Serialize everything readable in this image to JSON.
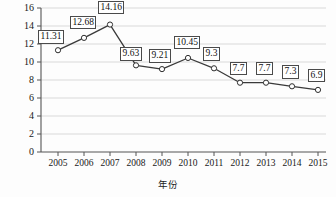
{
  "chart_data": {
    "type": "line",
    "title": "",
    "xlabel": "年份",
    "ylabel": "经济增速(%)",
    "categories": [
      "2005",
      "2006",
      "2007",
      "2008",
      "2009",
      "2010",
      "2011",
      "2012",
      "2013",
      "2014",
      "2015"
    ],
    "values": [
      11.31,
      12.68,
      14.16,
      9.63,
      9.21,
      10.45,
      9.3,
      7.7,
      7.7,
      7.3,
      6.9
    ],
    "data_labels": [
      "11.31",
      "12.68",
      "14.16",
      "9.63",
      "9.21",
      "10.45",
      "9.3",
      "7.7",
      "7.7",
      "7.3",
      "6.9"
    ],
    "ylim": [
      0,
      16
    ],
    "ytick_labels": [
      "0",
      "2",
      "4",
      "6",
      "8",
      "10",
      "12",
      "14",
      "16"
    ],
    "ytick_values": [
      0,
      2,
      4,
      6,
      8,
      10,
      12,
      14,
      16
    ],
    "grid": true,
    "legend": "none",
    "series_name": "经济增速",
    "colors": {
      "line": "#3a3a3a",
      "marker_fill": "#ffffff",
      "marker_edge": "#2e2e2e",
      "grid": "#d9d9d9",
      "axis": "#555555",
      "label_box_border": "#4a4a4a",
      "label_box_fill": "#ffffff",
      "background": "#fdfdfd",
      "text": "#181818"
    }
  }
}
